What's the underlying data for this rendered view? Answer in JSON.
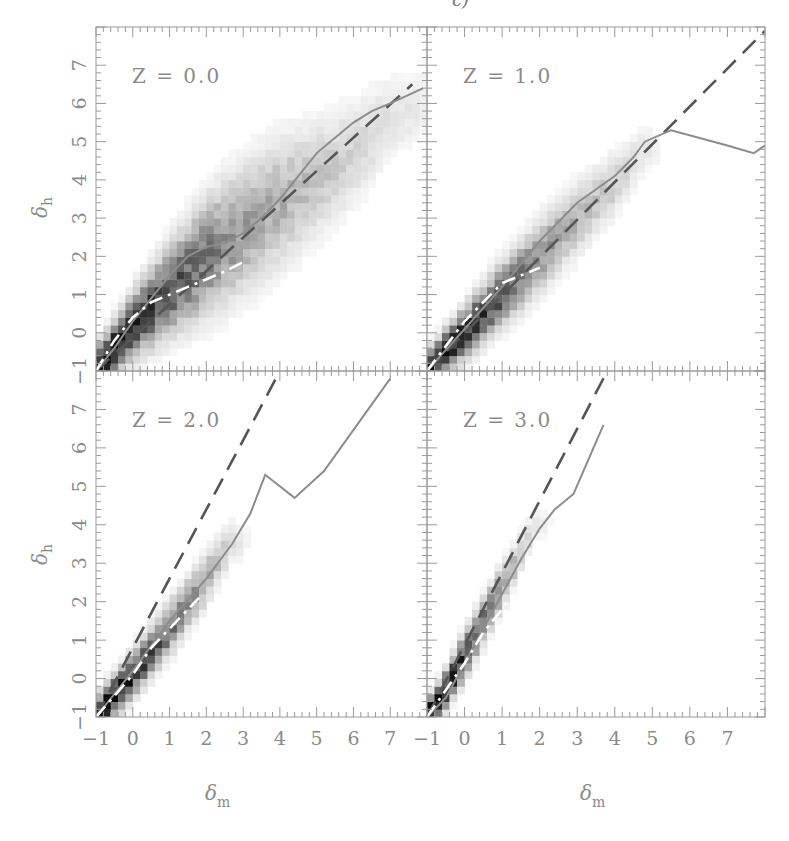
{
  "figure": {
    "caption_fragment": "c)",
    "x_axis_title": "δ",
    "x_axis_sub": "m",
    "y_axis_title": "δ",
    "y_axis_sub": "h"
  },
  "chart_data": [
    {
      "type": "heatmap",
      "panel": "top-left",
      "title": "Z = 0.0",
      "xlabel": "δ_m",
      "ylabel": "δ_h",
      "xlim": [
        -1,
        8
      ],
      "ylim": [
        -1,
        8
      ],
      "xticks": [
        -1,
        0,
        1,
        2,
        3,
        4,
        5,
        6,
        7
      ],
      "yticks": [
        -1,
        0,
        1,
        2,
        3,
        4,
        5,
        6,
        7
      ],
      "show_xticklabels": false,
      "show_yticklabels": true,
      "density": {
        "ridge": [
          [
            -1,
            -1
          ],
          [
            0,
            0.2
          ],
          [
            1,
            1.1
          ],
          [
            2,
            2.0
          ],
          [
            3,
            2.7
          ],
          [
            4,
            3.4
          ],
          [
            5,
            4.0
          ],
          [
            6,
            4.7
          ],
          [
            7,
            5.6
          ],
          [
            7.9,
            6.0
          ]
        ],
        "spread": [
          0.35,
          0.5,
          0.7,
          0.9,
          1.0,
          1.0,
          0.9,
          0.8,
          0.7,
          0.6
        ],
        "peak": [
          1.0,
          0.85,
          0.7,
          0.55,
          0.4,
          0.32,
          0.25,
          0.18,
          0.12,
          0.08
        ]
      },
      "series": [
        {
          "name": "dashed",
          "style": "dashed",
          "color": "#555555",
          "points": [
            [
              -1,
              -1
            ],
            [
              7.6,
              6.5
            ]
          ]
        },
        {
          "name": "solid",
          "style": "solid",
          "color": "#8c8c8c",
          "points": [
            [
              -1,
              -1
            ],
            [
              -0.5,
              -0.4
            ],
            [
              0,
              0.3
            ],
            [
              0.5,
              0.9
            ],
            [
              1,
              1.5
            ],
            [
              1.5,
              2.0
            ],
            [
              2,
              2.25
            ],
            [
              2.5,
              2.35
            ],
            [
              3,
              2.6
            ],
            [
              3.5,
              3.0
            ],
            [
              4,
              3.5
            ],
            [
              4.5,
              4.1
            ],
            [
              5,
              4.7
            ],
            [
              5.5,
              5.1
            ],
            [
              6,
              5.5
            ],
            [
              6.5,
              5.8
            ],
            [
              7,
              6.0
            ],
            [
              7.9,
              6.4
            ]
          ]
        },
        {
          "name": "dash-dot",
          "style": "dashdot",
          "color": "#ffffff",
          "points": [
            [
              -1,
              -1
            ],
            [
              -0.5,
              -0.2
            ],
            [
              0,
              0.4
            ],
            [
              0.5,
              0.8
            ],
            [
              1,
              1.0
            ],
            [
              1.5,
              1.2
            ],
            [
              2,
              1.4
            ],
            [
              2.5,
              1.6
            ],
            [
              3,
              1.85
            ]
          ]
        }
      ]
    },
    {
      "type": "heatmap",
      "panel": "top-right",
      "title": "Z = 1.0",
      "xlabel": "δ_m",
      "ylabel": "δ_h",
      "xlim": [
        -1,
        8
      ],
      "ylim": [
        -1,
        8
      ],
      "xticks": [
        -1,
        0,
        1,
        2,
        3,
        4,
        5,
        6,
        7
      ],
      "yticks": [
        -1,
        0,
        1,
        2,
        3,
        4,
        5,
        6,
        7
      ],
      "show_xticklabels": false,
      "show_yticklabels": false,
      "density": {
        "ridge": [
          [
            -1,
            -1
          ],
          [
            0,
            0.0
          ],
          [
            1,
            1.0
          ],
          [
            2,
            2.0
          ],
          [
            3,
            3.0
          ],
          [
            4,
            3.9
          ],
          [
            4.8,
            4.8
          ]
        ],
        "spread": [
          0.3,
          0.4,
          0.5,
          0.55,
          0.55,
          0.5,
          0.4
        ],
        "peak": [
          1.0,
          0.85,
          0.65,
          0.45,
          0.3,
          0.2,
          0.1
        ]
      },
      "series": [
        {
          "name": "dashed",
          "style": "dashed",
          "color": "#555555",
          "points": [
            [
              -1,
              -1
            ],
            [
              8,
              7.9
            ]
          ]
        },
        {
          "name": "solid",
          "style": "solid",
          "color": "#8c8c8c",
          "points": [
            [
              -1,
              -1
            ],
            [
              0,
              0.1
            ],
            [
              1,
              1.2
            ],
            [
              2,
              2.4
            ],
            [
              3,
              3.4
            ],
            [
              4,
              4.1
            ],
            [
              4.5,
              4.6
            ],
            [
              4.8,
              5.0
            ],
            [
              5.5,
              5.3
            ],
            [
              7,
              4.9
            ],
            [
              7.7,
              4.7
            ],
            [
              8,
              4.9
            ]
          ]
        },
        {
          "name": "dash-dot",
          "style": "dashdot",
          "color": "#ffffff",
          "points": [
            [
              -1,
              -1
            ],
            [
              0,
              0.3
            ],
            [
              0.5,
              0.8
            ],
            [
              1,
              1.3
            ],
            [
              1.5,
              1.5
            ],
            [
              2,
              1.7
            ]
          ]
        }
      ]
    },
    {
      "type": "heatmap",
      "panel": "bottom-left",
      "title": "Z = 2.0",
      "xlabel": "δ_m",
      "ylabel": "δ_h",
      "xlim": [
        -1,
        8
      ],
      "ylim": [
        -1,
        8
      ],
      "xticks": [
        -1,
        0,
        1,
        2,
        3,
        4,
        5,
        6,
        7
      ],
      "yticks": [
        -1,
        0,
        1,
        2,
        3,
        4,
        5,
        6,
        7
      ],
      "show_xticklabels": true,
      "show_yticklabels": true,
      "density": {
        "ridge": [
          [
            -1,
            -1
          ],
          [
            0,
            0.1
          ],
          [
            1,
            1.3
          ],
          [
            2,
            2.6
          ],
          [
            2.7,
            3.6
          ]
        ],
        "spread": [
          0.3,
          0.35,
          0.4,
          0.4,
          0.35
        ],
        "peak": [
          1.0,
          0.85,
          0.6,
          0.35,
          0.15
        ]
      },
      "series": [
        {
          "name": "dashed",
          "style": "dashed",
          "color": "#555555",
          "points": [
            [
              -1,
              -1
            ],
            [
              4,
              8
            ]
          ]
        },
        {
          "name": "solid",
          "style": "solid",
          "color": "#8c8c8c",
          "points": [
            [
              -1,
              -1
            ],
            [
              0,
              0.2
            ],
            [
              1,
              1.5
            ],
            [
              2,
              2.6
            ],
            [
              2.7,
              3.5
            ],
            [
              3.2,
              4.3
            ],
            [
              3.6,
              5.3
            ],
            [
              4.4,
              4.7
            ],
            [
              5.2,
              5.4
            ],
            [
              7,
              7.8
            ]
          ]
        },
        {
          "name": "dash-dot",
          "style": "dashdot",
          "color": "#ffffff",
          "points": [
            [
              -1,
              -1
            ],
            [
              0,
              0.1
            ],
            [
              0.5,
              0.8
            ],
            [
              1,
              1.3
            ],
            [
              1.8,
              2.1
            ]
          ]
        }
      ]
    },
    {
      "type": "heatmap",
      "panel": "bottom-right",
      "title": "Z = 3.0",
      "xlabel": "δ_m",
      "ylabel": "δ_h",
      "xlim": [
        -1,
        8
      ],
      "ylim": [
        -1,
        8
      ],
      "xticks": [
        -1,
        0,
        1,
        2,
        3,
        4,
        5,
        6,
        7
      ],
      "yticks": [
        -1,
        0,
        1,
        2,
        3,
        4,
        5,
        6,
        7
      ],
      "show_xticklabels": true,
      "show_yticklabels": false,
      "density": {
        "ridge": [
          [
            -1,
            -1
          ],
          [
            -0.5,
            -0.3
          ],
          [
            0,
            0.6
          ],
          [
            0.5,
            1.5
          ],
          [
            1,
            2.4
          ],
          [
            1.5,
            3.3
          ],
          [
            1.9,
            4.0
          ]
        ],
        "spread": [
          0.25,
          0.3,
          0.35,
          0.35,
          0.35,
          0.3,
          0.25
        ],
        "peak": [
          1.0,
          0.95,
          0.8,
          0.6,
          0.4,
          0.22,
          0.1
        ]
      },
      "series": [
        {
          "name": "dashed",
          "style": "dashed",
          "color": "#555555",
          "points": [
            [
              -1,
              -1
            ],
            [
              3.8,
              8
            ]
          ]
        },
        {
          "name": "solid",
          "style": "solid",
          "color": "#8c8c8c",
          "points": [
            [
              -1,
              -1
            ],
            [
              -0.5,
              -0.5
            ],
            [
              0,
              0.4
            ],
            [
              0.5,
              1.3
            ],
            [
              1,
              2.2
            ],
            [
              1.5,
              3.1
            ],
            [
              2,
              3.9
            ],
            [
              2.4,
              4.4
            ],
            [
              2.9,
              4.8
            ],
            [
              3.7,
              6.6
            ]
          ]
        },
        {
          "name": "dash-dot",
          "style": "dashdot",
          "color": "#ffffff",
          "points": [
            [
              -1,
              -1
            ],
            [
              0,
              0.4
            ],
            [
              0.5,
              1.2
            ],
            [
              1,
              1.8
            ],
            [
              1.2,
              2.1
            ]
          ]
        }
      ]
    }
  ]
}
